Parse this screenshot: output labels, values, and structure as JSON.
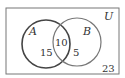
{
  "diagram": {
    "type": "venn",
    "universe_label": "U",
    "sets": [
      {
        "label": "A",
        "only": "15"
      },
      {
        "label": "B",
        "only": "5"
      }
    ],
    "intersection": "10",
    "outside": "23"
  }
}
